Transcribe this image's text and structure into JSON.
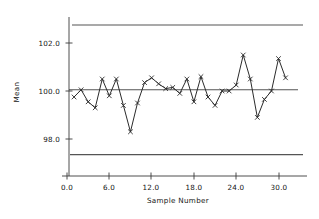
{
  "chart_data": {
    "type": "line",
    "title": "",
    "subtitle": "",
    "xlabel": "Sample  Number",
    "ylabel": "Mean",
    "xlim": [
      -1.2,
      33.0
    ],
    "ylim": [
      96.4,
      103.6
    ],
    "grid": false,
    "legend": null,
    "marker": "x",
    "x": [
      1,
      2,
      3,
      4,
      5,
      6,
      7,
      8,
      9,
      10,
      11,
      12,
      13,
      14,
      15,
      16,
      17,
      18,
      19,
      20,
      21,
      22,
      23,
      24,
      25,
      26,
      27,
      28,
      29,
      30,
      31
    ],
    "values": [
      99.75,
      100.05,
      99.55,
      99.3,
      100.5,
      99.8,
      100.5,
      99.4,
      98.3,
      99.5,
      100.35,
      100.55,
      100.3,
      100.1,
      100.15,
      99.9,
      100.5,
      99.55,
      100.6,
      99.75,
      99.4,
      100.0,
      100.0,
      100.25,
      101.5,
      100.5,
      98.9,
      99.65,
      100.0,
      101.35,
      100.55
    ],
    "series": [
      {
        "name": "Sample Mean",
        "values": [
          99.75,
          100.05,
          99.55,
          99.3,
          100.5,
          99.8,
          100.5,
          99.4,
          98.3,
          99.5,
          100.35,
          100.55,
          100.3,
          100.1,
          100.15,
          99.9,
          100.5,
          99.55,
          100.6,
          99.75,
          99.4,
          100.0,
          100.0,
          100.25,
          101.5,
          100.5,
          98.9,
          99.65,
          100.0,
          101.35,
          100.55
        ]
      }
    ],
    "reference_lines": [
      {
        "name": "upper-control-limit",
        "label": "UCL",
        "value": 102.75
      },
      {
        "name": "center-line",
        "label": "CL",
        "value": 100.05
      },
      {
        "name": "lower-control-limit",
        "label": "LCL",
        "value": 97.35
      }
    ],
    "xticks": [
      0.0,
      6.0,
      12.0,
      18.0,
      24.0,
      30.0
    ],
    "xtick_labels": [
      "0.0",
      "6.0",
      "12.0",
      "18.0",
      "24.0",
      "30.0"
    ],
    "yticks": [
      98.0,
      100.0,
      102.0
    ],
    "ytick_labels": [
      "98.0",
      "100.0",
      "102.0"
    ],
    "colors": {
      "series_line": "#2b2b2b",
      "marker": "#2b2b2b",
      "control_limit": "#555555",
      "center_line": "#555555",
      "axis": "#3a3a3a",
      "text": "#141414",
      "background": "#ffffff"
    }
  },
  "axes": {
    "y_title": "Mean",
    "x_title": "Sample  Number",
    "y_tick_labels": [
      "102.0",
      "100.0",
      "98.0"
    ],
    "x_tick_labels": [
      "0.0",
      "6.0",
      "12.0",
      "18.0",
      "24.0",
      "30.0"
    ]
  }
}
